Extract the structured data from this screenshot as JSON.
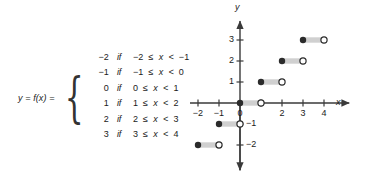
{
  "figure": {
    "colors": {
      "ink": "#1a1a1a",
      "axis": "#3a3a3a",
      "segment_bar": "#d0d0d0",
      "filled_dot": "#2b2b2b",
      "open_dot_stroke": "#2b2b2b",
      "open_dot_fill": "#ffffff",
      "background": "#ffffff"
    }
  },
  "definition": {
    "function_label": "y = f(x) =",
    "open_brace": "{",
    "cases": [
      {
        "value": "−2",
        "keyword": "if",
        "condition_prefix": "−2",
        "condition": "−2 ≤ x < −1",
        "lower": "−2",
        "rel1": "≤",
        "var": "x",
        "rel2": "<",
        "upper": "−1"
      },
      {
        "value": "−1",
        "keyword": "if",
        "condition_prefix": "−1",
        "condition": "−1 ≤ x < 0",
        "lower": "−1",
        "rel1": "≤",
        "var": "x",
        "rel2": "<",
        "upper": "0"
      },
      {
        "value": "0",
        "keyword": "if",
        "condition_prefix": "0",
        "condition": "0 ≤ x < 1",
        "lower": "0",
        "rel1": "≤",
        "var": "x",
        "rel2": "<",
        "upper": "1"
      },
      {
        "value": "1",
        "keyword": "if",
        "condition_prefix": "1",
        "condition": "1 ≤ x < 2",
        "lower": "1",
        "rel1": "≤",
        "var": "x",
        "rel2": "<",
        "upper": "2"
      },
      {
        "value": "2",
        "keyword": "if",
        "condition_prefix": "2",
        "condition": "2 ≤ x < 3",
        "lower": "2",
        "rel1": "≤",
        "var": "x",
        "rel2": "<",
        "upper": "3"
      },
      {
        "value": "3",
        "keyword": "if",
        "condition_prefix": "3",
        "condition": "3 ≤ x < 4",
        "lower": "3",
        "rel1": "≤",
        "var": "x",
        "rel2": "<",
        "upper": "4"
      }
    ]
  },
  "chart_data": {
    "type": "line",
    "subtype": "step-function",
    "title": "",
    "xlabel": "x",
    "ylabel": "y",
    "xlim": [
      -2.7,
      5.2
    ],
    "ylim": [
      -3.2,
      3.9
    ],
    "grid": false,
    "legend": null,
    "x_ticks": [
      -2,
      -1,
      0,
      2,
      3,
      4
    ],
    "x_tick_labels": [
      "−2",
      "−1",
      "0",
      "2",
      "3",
      "4"
    ],
    "y_ticks": [
      3,
      2,
      1,
      -1,
      -2
    ],
    "y_tick_labels": [
      "3",
      "2",
      "1",
      "−1",
      "−2"
    ],
    "hidden_x_ticks": [
      1
    ],
    "segments": [
      {
        "y": -2,
        "x_start": -2,
        "x_end": -1,
        "closed_left": true,
        "closed_right": false
      },
      {
        "y": -1,
        "x_start": -1,
        "x_end": 0,
        "closed_left": true,
        "closed_right": false
      },
      {
        "y": 0,
        "x_start": 0,
        "x_end": 1,
        "closed_left": true,
        "closed_right": false
      },
      {
        "y": 1,
        "x_start": 1,
        "x_end": 2,
        "closed_left": true,
        "closed_right": false
      },
      {
        "y": 2,
        "x_start": 2,
        "x_end": 3,
        "closed_left": true,
        "closed_right": false
      },
      {
        "y": 3,
        "x_start": 3,
        "x_end": 4,
        "closed_left": true,
        "closed_right": false
      }
    ]
  },
  "axes": {
    "x_axis_label": "x",
    "y_axis_label": "y"
  }
}
